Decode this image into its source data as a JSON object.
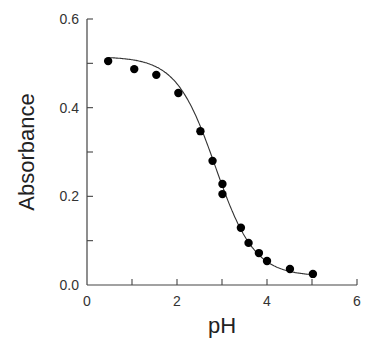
{
  "chart_data": {
    "type": "scatter",
    "title": "",
    "xlabel": "pH",
    "ylabel": "Absorbance",
    "xlim": [
      0,
      6
    ],
    "ylim": [
      0.0,
      0.6
    ],
    "x_ticks": [
      0,
      2,
      4,
      6
    ],
    "x_tick_labels": [
      "0",
      "2",
      "4",
      "6"
    ],
    "x_minor_ticks": [
      1,
      3,
      5
    ],
    "y_ticks": [
      0.0,
      0.2,
      0.4,
      0.6
    ],
    "y_tick_labels": [
      "0.0",
      "0.2",
      "0.4",
      "0.6"
    ],
    "y_minor_ticks": [
      0.1,
      0.3,
      0.5
    ],
    "grid": false,
    "legend": null,
    "series": [
      {
        "name": "data",
        "style": "markers",
        "x": [
          0.47,
          1.05,
          1.54,
          2.03,
          2.52,
          2.79,
          3.01,
          3.01,
          3.42,
          3.59,
          3.82,
          4.0,
          4.51,
          5.02
        ],
        "y": [
          0.505,
          0.487,
          0.474,
          0.433,
          0.347,
          0.28,
          0.228,
          0.205,
          0.129,
          0.095,
          0.072,
          0.054,
          0.036,
          0.025
        ]
      },
      {
        "name": "fit",
        "style": "line",
        "model": "sigmoid",
        "params": {
          "A_acid": 0.515,
          "A_base": 0.02,
          "pKa": 2.85
        }
      }
    ]
  }
}
